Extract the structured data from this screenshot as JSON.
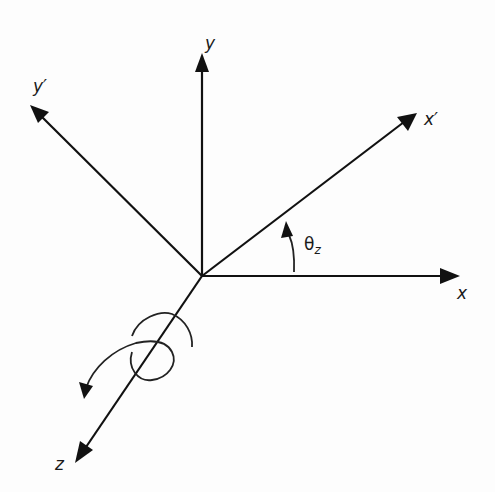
{
  "diagram": {
    "labels": {
      "x": "x",
      "y": "y",
      "z": "z",
      "x_prime": "x′",
      "y_prime": "y′",
      "theta": "θ",
      "theta_sub": "z"
    },
    "colors": {
      "stroke": "#111111",
      "background": "#fdfdfd"
    }
  }
}
